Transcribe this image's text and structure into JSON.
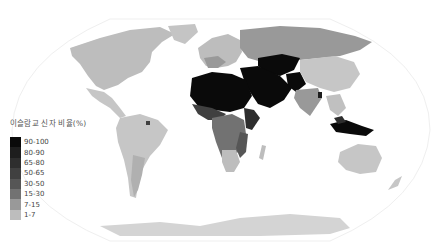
{
  "map": {
    "title": "이슬람교 신자 비율(%)",
    "subject": "Share of Muslim population by country",
    "projection": "robinson-like world map"
  },
  "legend": {
    "title": "이슬람교 신자 비율(%)",
    "items": [
      {
        "label": "90-100",
        "color": "#0a0a0a"
      },
      {
        "label": "80-90",
        "color": "#1e1e1e"
      },
      {
        "label": "65-80",
        "color": "#2e2e2e"
      },
      {
        "label": "50-65",
        "color": "#404040"
      },
      {
        "label": "30-50",
        "color": "#565656"
      },
      {
        "label": "15-30",
        "color": "#727272"
      },
      {
        "label": "7-15",
        "color": "#999999"
      },
      {
        "label": "1-7",
        "color": "#bdbdbd"
      }
    ]
  },
  "colors": {
    "no_data_land": "#c8c8c8",
    "ocean": "#ffffff",
    "graticule": "#eeeeee"
  }
}
